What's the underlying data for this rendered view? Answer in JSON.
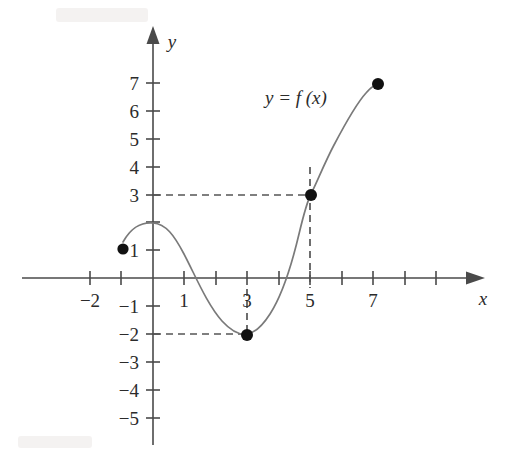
{
  "figure": {
    "background_color": "#ffffff",
    "curve_color": "#7a7a7a",
    "axis_color": "#4a4a4a",
    "dot_color": "#111111",
    "dash_color": "#555555"
  },
  "labels": {
    "curve_label": "y = f (x)",
    "x_axis_name": "x",
    "y_axis_name": "y"
  },
  "axes": {
    "x_ticks": [
      {
        "value": -2,
        "label": "−2",
        "px": 90
      },
      {
        "value": -1,
        "label": "",
        "px": 121
      },
      {
        "value": 1,
        "label": "1",
        "px": 184
      },
      {
        "value": 2,
        "label": "",
        "px": 216
      },
      {
        "value": 3,
        "label": "3",
        "px": 247
      },
      {
        "value": 4,
        "label": "",
        "px": 279
      },
      {
        "value": 5,
        "label": "5",
        "px": 310
      },
      {
        "value": 6,
        "label": "",
        "px": 342
      },
      {
        "value": 7,
        "label": "7",
        "px": 373
      },
      {
        "value": 8,
        "label": "",
        "px": 405
      },
      {
        "value": 9,
        "label": "",
        "px": 436
      }
    ],
    "y_ticks": [
      {
        "value": 7,
        "label": "7",
        "px": 83
      },
      {
        "value": 6,
        "label": "6",
        "px": 111
      },
      {
        "value": 5,
        "label": "5",
        "px": 139
      },
      {
        "value": 4,
        "label": "4",
        "px": 167
      },
      {
        "value": 3,
        "label": "3",
        "px": 195
      },
      {
        "value": 2,
        "label": "",
        "px": 222
      },
      {
        "value": 1,
        "label": "1",
        "px": 250
      },
      {
        "value": -1,
        "label": "−1",
        "px": 306
      },
      {
        "value": -2,
        "label": "−2",
        "px": 334
      },
      {
        "value": -3,
        "label": "−3",
        "px": 362
      },
      {
        "value": -4,
        "label": "−4",
        "px": 390
      },
      {
        "value": -5,
        "label": "−5",
        "px": 418
      }
    ]
  },
  "chart_data": {
    "type": "line",
    "title": "y = f (x)",
    "xlabel": "x",
    "ylabel": "y",
    "xlim": [
      -2.6,
      9.4
    ],
    "ylim": [
      -5.8,
      7.8
    ],
    "grid": false,
    "legend": null,
    "series": [
      {
        "name": "y = f (x)",
        "x": [
          -1.0,
          -0.6,
          -0.2,
          0.2,
          0.6,
          1.0,
          1.4,
          1.8,
          2.2,
          2.6,
          3.0,
          3.4,
          3.8,
          4.2,
          4.5,
          4.8,
          5.0,
          5.3,
          5.7,
          6.1,
          6.5,
          6.9,
          7.2
        ],
        "y": [
          1.3,
          1.72,
          1.9,
          1.88,
          1.55,
          0.85,
          0.0,
          -0.85,
          -1.5,
          -1.9,
          -2.0,
          -1.88,
          -1.45,
          -0.6,
          0.0,
          1.55,
          3.0,
          4.3,
          5.4,
          6.1,
          6.55,
          6.85,
          7.0
        ]
      }
    ],
    "marked_points": [
      {
        "x": -1.0,
        "y": 1.3,
        "type": "endpoint-closed",
        "label": ""
      },
      {
        "x": 3.0,
        "y": -2.0,
        "type": "local-minimum",
        "label": ""
      },
      {
        "x": 5.0,
        "y": 3.0,
        "type": "point",
        "label": ""
      },
      {
        "x": 7.2,
        "y": 7.0,
        "type": "endpoint-closed",
        "label": ""
      }
    ],
    "guide_lines": [
      {
        "orientation": "horizontal",
        "y": 3,
        "from_x": 0,
        "to_x": 5,
        "style": "dashed"
      },
      {
        "orientation": "vertical",
        "x": 5,
        "from_y": 4,
        "to_y": -0.35,
        "style": "dashed"
      },
      {
        "orientation": "horizontal",
        "y": -2,
        "from_x": 0,
        "to_x": 3,
        "style": "dashed"
      },
      {
        "orientation": "vertical",
        "x": 3,
        "from_y": -0.4,
        "to_y": -2,
        "style": "dashed"
      }
    ]
  }
}
